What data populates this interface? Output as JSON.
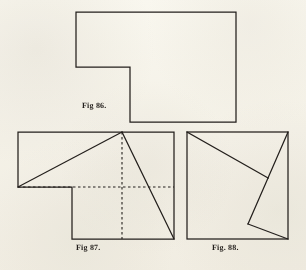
{
  "page": {
    "kind": "engraved-plate",
    "background_color": "#fbfaf6",
    "ink_color": "#231f1c",
    "width": 306,
    "height": 270
  },
  "figures": [
    {
      "id": "fig-86",
      "caption": "Fig 86.",
      "description": "L-shaped hexagonal outline",
      "shape": "L-polygon",
      "vertices": [
        [
          76,
          12
        ],
        [
          236,
          12
        ],
        [
          236,
          122
        ],
        [
          130,
          122
        ],
        [
          130,
          67
        ],
        [
          76,
          67
        ]
      ],
      "closed": true,
      "dashed_lines": [],
      "solid_cuts": []
    },
    {
      "id": "fig-87",
      "caption": "Fig 87.",
      "description": "L-shaped outline with two solid dissection cuts and dashed median guide lines",
      "shape": "L-polygon",
      "vertices": [
        [
          18,
          132
        ],
        [
          174,
          132
        ],
        [
          174,
          239
        ],
        [
          72,
          239
        ],
        [
          72,
          187
        ],
        [
          18,
          187
        ]
      ],
      "closed": true,
      "solid_cuts": [
        [
          [
            18,
            187
          ],
          [
            122,
            132
          ]
        ],
        [
          [
            122,
            132
          ],
          [
            174,
            239
          ]
        ]
      ],
      "dashed_lines": [
        [
          [
            122,
            132
          ],
          [
            122,
            239
          ]
        ],
        [
          [
            18,
            187
          ],
          [
            174,
            187
          ]
        ]
      ]
    },
    {
      "id": "fig-88",
      "caption": "Fig. 88.",
      "description": "Square outline with a zigzag dissection forming reassembled pieces",
      "shape": "square",
      "vertices": [
        [
          187,
          132
        ],
        [
          288,
          132
        ],
        [
          288,
          239
        ],
        [
          187,
          239
        ]
      ],
      "closed": true,
      "solid_cuts": [
        [
          [
            187,
            132
          ],
          [
            268,
            178
          ]
        ],
        [
          [
            268,
            178
          ],
          [
            288,
            132
          ]
        ],
        [
          [
            268,
            178
          ],
          [
            248,
            224
          ]
        ],
        [
          [
            248,
            224
          ],
          [
            288,
            239
          ]
        ]
      ],
      "dashed_lines": []
    }
  ],
  "captions": {
    "fig86": "Fig 86.",
    "fig87": "Fig 87.",
    "fig88": "Fig. 88."
  },
  "style": {
    "stroke_width": 1.25,
    "dash_pattern": "2.5 2.5",
    "caption_font_size": 8
  }
}
